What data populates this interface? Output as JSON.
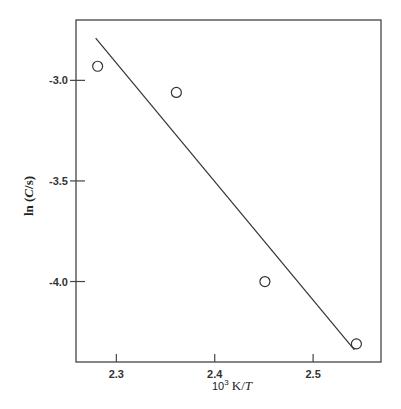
{
  "chart_data": {
    "type": "scatter",
    "title": "",
    "xlabel": "10³ K/T",
    "xlabel_parts": {
      "base": "10",
      "sup": "3",
      "rest": " K/",
      "italic": "T"
    },
    "ylabel": "ln (C/s)",
    "ylabel_parts": {
      "pre": "ln (",
      "italic": "C",
      "post": "/s)"
    },
    "xlim": [
      2.259,
      2.569
    ],
    "ylim": [
      -4.4,
      -2.7
    ],
    "xticks": [
      2.3,
      2.4,
      2.5
    ],
    "xtick_labels": [
      "2.3",
      "2.4",
      "2.5"
    ],
    "yticks": [
      -3.0,
      -3.5,
      -4.0
    ],
    "ytick_labels": [
      "-3.0",
      "-3.5",
      "-4.0"
    ],
    "grid": false,
    "legend": null,
    "series": [
      {
        "name": "data",
        "marker": "open-circle",
        "x": [
          2.281,
          2.361,
          2.451,
          2.544
        ],
        "y": [
          -2.93,
          -3.06,
          -4.0,
          -4.31
        ]
      },
      {
        "name": "fit",
        "style": "line",
        "x": [
          2.279,
          2.542
        ],
        "y": [
          -2.79,
          -4.34
        ]
      }
    ]
  },
  "colors": {
    "ink": "#333333",
    "background": "#ffffff"
  }
}
